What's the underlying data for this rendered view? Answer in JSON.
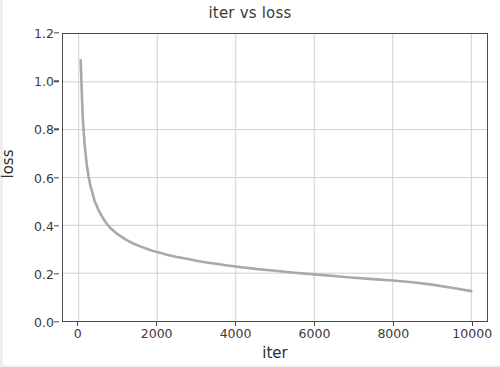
{
  "figure": {
    "title": "iter vs loss",
    "background_color": "#ffffff",
    "axis_color": "#4a4a4a",
    "grid_color": "#d0d0d0",
    "text_color": "#3b3b3b"
  },
  "axes": {
    "xlabel": "iter",
    "ylabel": "loss",
    "xticklabels": [
      "0",
      "2000",
      "4000",
      "6000",
      "8000",
      "10000"
    ],
    "yticklabels": [
      "0.0",
      "0.2",
      "0.4",
      "0.6",
      "0.8",
      "1.0",
      "1.2"
    ]
  },
  "chart_data": {
    "type": "line",
    "title": "iter vs loss",
    "xlabel": "iter",
    "ylabel": "loss",
    "xlim": [
      -400,
      10400
    ],
    "ylim": [
      0.0,
      1.2
    ],
    "xticks": [
      0,
      2000,
      4000,
      6000,
      8000,
      10000
    ],
    "yticks": [
      0.0,
      0.2,
      0.4,
      0.6,
      0.8,
      1.0,
      1.2
    ],
    "grid": true,
    "legend": null,
    "line_color": "#a9a9a9",
    "line_width": 2.6,
    "series": [
      {
        "name": "loss",
        "x": [
          50,
          100,
          150,
          200,
          250,
          300,
          400,
          500,
          600,
          700,
          800,
          900,
          1000,
          1200,
          1400,
          1600,
          1800,
          2000,
          2250,
          2500,
          2750,
          3000,
          3250,
          3500,
          3750,
          4000,
          4500,
          5000,
          5500,
          6000,
          6500,
          7000,
          7500,
          8000,
          8500,
          9000,
          9500,
          10000
        ],
        "y": [
          1.09,
          0.86,
          0.74,
          0.66,
          0.605,
          0.565,
          0.505,
          0.465,
          0.435,
          0.41,
          0.39,
          0.375,
          0.362,
          0.34,
          0.323,
          0.31,
          0.298,
          0.288,
          0.277,
          0.268,
          0.26,
          0.252,
          0.245,
          0.239,
          0.233,
          0.228,
          0.218,
          0.21,
          0.202,
          0.195,
          0.188,
          0.181,
          0.175,
          0.169,
          0.162,
          0.152,
          0.139,
          0.125
        ]
      }
    ]
  }
}
